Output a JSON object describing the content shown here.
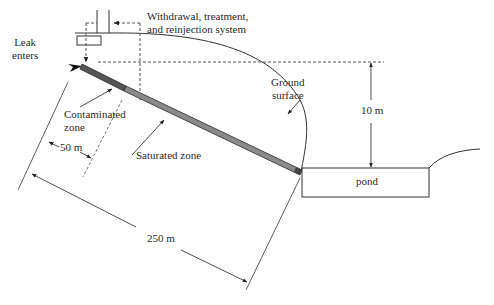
{
  "labels": {
    "system": "Withdrawal, treatment,",
    "system_line2": "and reinjection system",
    "leak_line1": "Leak",
    "leak_line2": "enters",
    "contaminated_line1": "Contaminated",
    "contaminated_line2": "zone",
    "saturated": "Saturated zone",
    "ground_line1": "Ground",
    "ground_line2": "surface",
    "depth": "10 m",
    "contaminated_length": "50 m",
    "total_length": "250 m",
    "pond": "pond"
  },
  "colors": {
    "line": "#333333",
    "dashed": "#555555",
    "contaminated_fill": "#555555",
    "saturated_fill": "#8a8a8a",
    "pipe_edge": "#2a2a2a"
  }
}
